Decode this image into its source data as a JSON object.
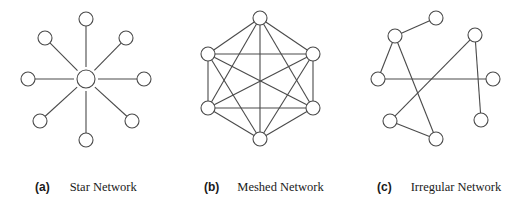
{
  "figure": {
    "panels": [
      {
        "id": "a",
        "tag": "(a)",
        "title": "Star Network",
        "node_radius": 7,
        "hub": {
          "x": 86,
          "y": 79,
          "r": 9
        },
        "nodes": [
          {
            "x": 86,
            "y": 19
          },
          {
            "x": 126,
            "y": 38
          },
          {
            "x": 144,
            "y": 79
          },
          {
            "x": 132,
            "y": 121
          },
          {
            "x": 86,
            "y": 140
          },
          {
            "x": 40,
            "y": 121
          },
          {
            "x": 28,
            "y": 79
          },
          {
            "x": 45,
            "y": 38
          }
        ]
      },
      {
        "id": "b",
        "tag": "(b)",
        "title": "Meshed Network",
        "node_radius": 7,
        "nodes": [
          {
            "x": 260,
            "y": 18
          },
          {
            "x": 313,
            "y": 54
          },
          {
            "x": 313,
            "y": 108
          },
          {
            "x": 260,
            "y": 139
          },
          {
            "x": 208,
            "y": 108
          },
          {
            "x": 208,
            "y": 54
          }
        ],
        "edges": "complete"
      },
      {
        "id": "c",
        "tag": "(c)",
        "title": "Irregular Network",
        "node_radius": 7,
        "nodes": [
          {
            "x": 436,
            "y": 18
          },
          {
            "x": 395,
            "y": 36
          },
          {
            "x": 475,
            "y": 35
          },
          {
            "x": 378,
            "y": 79
          },
          {
            "x": 493,
            "y": 79
          },
          {
            "x": 390,
            "y": 121
          },
          {
            "x": 481,
            "y": 120
          },
          {
            "x": 436,
            "y": 139
          }
        ],
        "edges": [
          [
            0,
            1
          ],
          [
            1,
            3
          ],
          [
            1,
            7
          ],
          [
            3,
            4
          ],
          [
            2,
            5
          ],
          [
            2,
            6
          ],
          [
            5,
            7
          ]
        ]
      }
    ]
  },
  "captions": {
    "a": {
      "tag": "(a)",
      "text": "Star Network"
    },
    "b": {
      "tag": "(b)",
      "text": "Meshed Network"
    },
    "c": {
      "tag": "(c)",
      "text": "Irregular Network"
    }
  }
}
